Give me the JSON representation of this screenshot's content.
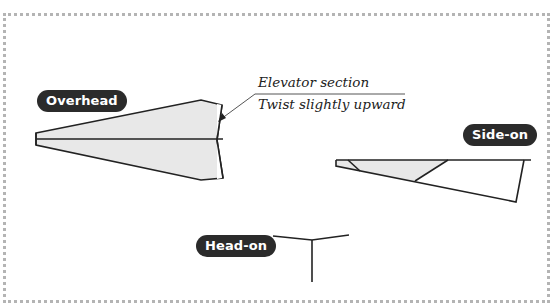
{
  "diagram": {
    "labels": {
      "overhead": "Overhead",
      "side_on": "Side-on",
      "head_on": "Head-on"
    },
    "callout": {
      "line1": "Elevator section",
      "line2": "Twist slightly upward"
    },
    "colors": {
      "pill_bg": "#2b2b2b",
      "pill_text": "#ffffff",
      "fill": "#e8e8e8",
      "stroke": "#222222",
      "frame": "#b4b4b4"
    },
    "icons": {
      "leader_arrow": "arrow-icon"
    }
  }
}
